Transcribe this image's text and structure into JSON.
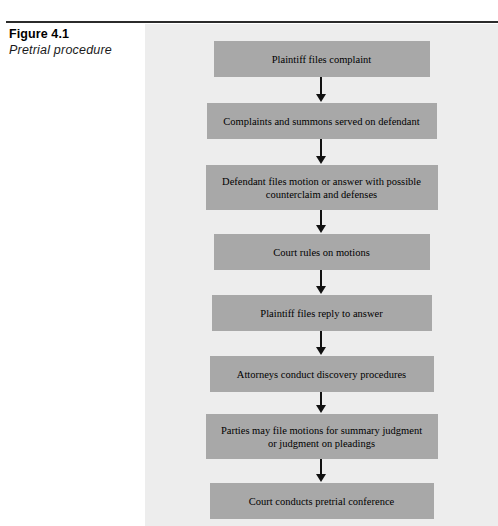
{
  "caption": {
    "figure_number": "Figure 4.1",
    "figure_title": "Pretrial procedure"
  },
  "colors": {
    "page_background": "#ffffff",
    "panel_background": "#ededed",
    "box_fill": "#a8a8a8",
    "box_text": "#000000",
    "rule": "#2b2b2b",
    "arrow": "#111111"
  },
  "chart_data": {
    "type": "diagram",
    "diagram_kind": "flowchart",
    "title": "Figure 4.1",
    "subtitle": "Pretrial procedure",
    "orientation": "top-to-bottom",
    "connector": "down-arrow",
    "nodes": [
      {
        "id": "step-1",
        "order": 1,
        "lines": [
          "Plaintiff files complaint"
        ],
        "text": "Plaintiff files complaint",
        "x": 121,
        "y": 17,
        "width": 216,
        "height": 36
      },
      {
        "id": "step-2",
        "order": 2,
        "lines": [
          "Complaints and summons served on defendant"
        ],
        "text": "Complaints and summons served on defendant",
        "x": 115,
        "y": 79,
        "width": 230,
        "height": 36
      },
      {
        "id": "step-3",
        "order": 3,
        "lines": [
          "Defendant files motion or answer with possible",
          "counterclaim and defenses"
        ],
        "text": "Defendant files motion or answer with possible counterclaim and defenses",
        "x": 113,
        "y": 141,
        "width": 232,
        "height": 45
      },
      {
        "id": "step-4",
        "order": 4,
        "lines": [
          "Court rules on motions"
        ],
        "text": "Court rules on motions",
        "x": 121,
        "y": 210,
        "width": 216,
        "height": 36
      },
      {
        "id": "step-5",
        "order": 5,
        "lines": [
          "Plaintiff files reply to answer"
        ],
        "text": "Plaintiff files reply to answer",
        "x": 119,
        "y": 271,
        "width": 220,
        "height": 36
      },
      {
        "id": "step-6",
        "order": 6,
        "lines": [
          "Attorneys conduct discovery  procedures"
        ],
        "text": "Attorneys conduct discovery  procedures",
        "x": 117,
        "y": 332,
        "width": 224,
        "height": 36
      },
      {
        "id": "step-7",
        "order": 7,
        "lines": [
          "Parties may file motions for summary judgment",
          "or judgment on pleadings"
        ],
        "text": "Parties may file motions for summary judgment or judgment on pleadings",
        "x": 113,
        "y": 390,
        "width": 232,
        "height": 45
      },
      {
        "id": "step-8",
        "order": 8,
        "lines": [
          "Court conducts pretrial conference"
        ],
        "text": "Court conducts pretrial conference",
        "x": 117,
        "y": 459,
        "width": 224,
        "height": 36
      }
    ],
    "edges": [
      {
        "from": "step-1",
        "to": "step-2",
        "label": ""
      },
      {
        "from": "step-2",
        "to": "step-3",
        "label": ""
      },
      {
        "from": "step-3",
        "to": "step-4",
        "label": ""
      },
      {
        "from": "step-4",
        "to": "step-5",
        "label": ""
      },
      {
        "from": "step-5",
        "to": "step-6",
        "label": ""
      },
      {
        "from": "step-6",
        "to": "step-7",
        "label": ""
      },
      {
        "from": "step-7",
        "to": "step-8",
        "label": ""
      }
    ]
  }
}
